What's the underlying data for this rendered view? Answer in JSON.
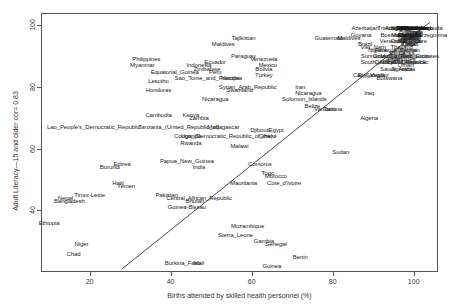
{
  "chart_data": {
    "type": "scatter",
    "title": "",
    "xlabel": "Births attended by skilled health personnel (%)",
    "ylabel": "Adult Literacy—15 and older cor= 0.83",
    "correlation": 0.83,
    "xlim": [
      8,
      106
    ],
    "ylim": [
      20,
      104
    ],
    "xticks": [
      20,
      40,
      60,
      80,
      100
    ],
    "yticks": [
      40,
      60,
      80,
      100
    ],
    "grid": false,
    "legend": "none",
    "marker": "text-label",
    "fit_line": {
      "x0": 28,
      "y0": 21,
      "x1": 104,
      "y1": 101
    },
    "points": [
      {
        "label": "Ethiopia",
        "x": 10,
        "y": 36
      },
      {
        "label": "Niger",
        "x": 18,
        "y": 29
      },
      {
        "label": "Chad",
        "x": 16,
        "y": 26
      },
      {
        "label": "Bangladesh",
        "x": 15,
        "y": 43
      },
      {
        "label": "Nepal",
        "x": 14,
        "y": 44
      },
      {
        "label": "Timor-Leste",
        "x": 20,
        "y": 45
      },
      {
        "label": "Haiti",
        "x": 27,
        "y": 49
      },
      {
        "label": "Yemen",
        "x": 29,
        "y": 48
      },
      {
        "label": "Burundi",
        "x": 25,
        "y": 54
      },
      {
        "label": "Eritrea",
        "x": 28,
        "y": 55
      },
      {
        "label": "Lao_People's_Democratic_Republic",
        "x": 21,
        "y": 67
      },
      {
        "label": "Cambodia",
        "x": 37,
        "y": 71
      },
      {
        "label": "Kenya",
        "x": 45,
        "y": 71
      },
      {
        "label": "Tanzania_(United_Republic_of)",
        "x": 42,
        "y": 67
      },
      {
        "label": "Uganda",
        "x": 45,
        "y": 64
      },
      {
        "label": "Rwanda",
        "x": 45,
        "y": 62
      },
      {
        "label": "Madagascar",
        "x": 53,
        "y": 67
      },
      {
        "label": "Djibouti",
        "x": 62,
        "y": 66
      },
      {
        "label": "Congo_(Democratic_Republic_of_the)",
        "x": 53,
        "y": 64
      },
      {
        "label": "Ghana",
        "x": 64,
        "y": 64
      },
      {
        "label": "Malawi",
        "x": 57,
        "y": 61
      },
      {
        "label": "India",
        "x": 47,
        "y": 54
      },
      {
        "label": "Papua_New_Guinea",
        "x": 44,
        "y": 56
      },
      {
        "label": "Pakistan",
        "x": 39,
        "y": 45
      },
      {
        "label": "Central_African_Republic",
        "x": 47,
        "y": 44
      },
      {
        "label": "Bhutan",
        "x": 46,
        "y": 43
      },
      {
        "label": "Guinea-Bissau",
        "x": 44,
        "y": 41
      },
      {
        "label": "Sierra_Leone",
        "x": 56,
        "y": 32
      },
      {
        "label": "Mozambique",
        "x": 59,
        "y": 35
      },
      {
        "label": "Gambia",
        "x": 63,
        "y": 30
      },
      {
        "label": "Senegal",
        "x": 66,
        "y": 29
      },
      {
        "label": "Benin",
        "x": 72,
        "y": 25
      },
      {
        "label": "Guinea",
        "x": 65,
        "y": 22
      },
      {
        "label": "Burkina_Faso",
        "x": 43,
        "y": 23
      },
      {
        "label": "Mali",
        "x": 47,
        "y": 23
      },
      {
        "label": "Mauritania",
        "x": 58,
        "y": 49
      },
      {
        "label": "Comoros",
        "x": 62,
        "y": 55
      },
      {
        "label": "Togo",
        "x": 64,
        "y": 52
      },
      {
        "label": "Morocco",
        "x": 66,
        "y": 51
      },
      {
        "label": "Cote_d'Ivoire",
        "x": 68,
        "y": 49
      },
      {
        "label": "Sudan",
        "x": 82,
        "y": 59
      },
      {
        "label": "Egypt",
        "x": 66,
        "y": 66
      },
      {
        "label": "Nicaragua",
        "x": 51,
        "y": 76
      },
      {
        "label": "Swaziland",
        "x": 57,
        "y": 79
      },
      {
        "label": "Syrian_Arab_Republic",
        "x": 59,
        "y": 80
      },
      {
        "label": "Honduras",
        "x": 37,
        "y": 79
      },
      {
        "label": "Lesotho",
        "x": 37,
        "y": 82
      },
      {
        "label": "Equatorial_Guinea",
        "x": 41,
        "y": 85
      },
      {
        "label": "Sao_Tome_and_Principe",
        "x": 49,
        "y": 83
      },
      {
        "label": "Namibia",
        "x": 55,
        "y": 83
      },
      {
        "label": "Myanmar",
        "x": 33,
        "y": 87
      },
      {
        "label": "Philippines",
        "x": 34,
        "y": 89
      },
      {
        "label": "Indonesia",
        "x": 47,
        "y": 87
      },
      {
        "label": "Zimbabwe",
        "x": 49,
        "y": 86
      },
      {
        "label": "Peru",
        "x": 51,
        "y": 85
      },
      {
        "label": "Ecuador",
        "x": 51,
        "y": 88
      },
      {
        "label": "Paraguay",
        "x": 58,
        "y": 90
      },
      {
        "label": "Venezuela",
        "x": 63,
        "y": 89
      },
      {
        "label": "Mexico",
        "x": 64,
        "y": 87
      },
      {
        "label": "Bolivia",
        "x": 63,
        "y": 86
      },
      {
        "label": "Turkey",
        "x": 63,
        "y": 84
      },
      {
        "label": "Iran",
        "x": 72,
        "y": 80
      },
      {
        "label": "Maldives",
        "x": 53,
        "y": 94
      },
      {
        "label": "Tajikistan",
        "x": 58,
        "y": 96
      },
      {
        "label": "Solomon_Islands",
        "x": 73,
        "y": 76
      },
      {
        "label": "Belize",
        "x": 75,
        "y": 74
      },
      {
        "label": "Vanuatu",
        "x": 78,
        "y": 73
      },
      {
        "label": "Tunisia",
        "x": 80,
        "y": 73
      },
      {
        "label": "Algeria",
        "x": 89,
        "y": 70
      },
      {
        "label": "Guyana",
        "x": 87,
        "y": 97
      },
      {
        "label": "Guatemala",
        "x": 79,
        "y": 96
      },
      {
        "label": "Brazil",
        "x": 88,
        "y": 94
      },
      {
        "label": "Nigeria",
        "x": 91,
        "y": 92
      },
      {
        "label": "Colombia",
        "x": 93,
        "y": 90
      },
      {
        "label": "Jordan",
        "x": 95,
        "y": 89
      },
      {
        "label": "China",
        "x": 96,
        "y": 91
      },
      {
        "label": "Thailand",
        "x": 97,
        "y": 93
      },
      {
        "label": "Panama",
        "x": 93,
        "y": 92
      },
      {
        "label": "Chile",
        "x": 99,
        "y": 96
      },
      {
        "label": "Costa_Rica",
        "x": 98,
        "y": 95
      },
      {
        "label": "Uruguay",
        "x": 99,
        "y": 97
      },
      {
        "label": "Argentina",
        "x": 99,
        "y": 97
      },
      {
        "label": "Cuba",
        "x": 100,
        "y": 99
      },
      {
        "label": "Malaysia",
        "x": 98,
        "y": 92
      },
      {
        "label": "Mongolia",
        "x": 99,
        "y": 97
      },
      {
        "label": "Kazakhstan",
        "x": 100,
        "y": 99
      },
      {
        "label": "Ukraine",
        "x": 100,
        "y": 99
      },
      {
        "label": "Romania",
        "x": 99,
        "y": 97
      },
      {
        "label": "Bulgaria",
        "x": 99,
        "y": 98
      },
      {
        "label": "Croatia",
        "x": 100,
        "y": 98
      },
      {
        "label": "Lithuania",
        "x": 100,
        "y": 99
      },
      {
        "label": "Latvia",
        "x": 100,
        "y": 99
      },
      {
        "label": "Estonia",
        "x": 100,
        "y": 99
      },
      {
        "label": "Poland",
        "x": 99,
        "y": 99
      },
      {
        "label": "Slovakia",
        "x": 99,
        "y": 99
      },
      {
        "label": "Belarus",
        "x": 100,
        "y": 99
      },
      {
        "label": "Armenia",
        "x": 98,
        "y": 99
      },
      {
        "label": "Georgia",
        "x": 98,
        "y": 99
      },
      {
        "label": "Azerbaijan",
        "x": 88,
        "y": 99
      },
      {
        "label": "Kyrgyzstan",
        "x": 98,
        "y": 99
      },
      {
        "label": "Uzbekistan",
        "x": 100,
        "y": 99
      },
      {
        "label": "Moldova",
        "x": 99,
        "y": 99
      },
      {
        "label": "Serbia",
        "x": 99,
        "y": 96
      },
      {
        "label": "Albania",
        "x": 99,
        "y": 96
      },
      {
        "label": "Lebanon",
        "x": 98,
        "y": 90
      },
      {
        "label": "Kuwait",
        "x": 99,
        "y": 94
      },
      {
        "label": "Bahrain",
        "x": 99,
        "y": 92
      },
      {
        "label": "Qatar",
        "x": 99,
        "y": 94
      },
      {
        "label": "United_Arab_Emirates",
        "x": 99,
        "y": 90
      },
      {
        "label": "Saudi_Arabia",
        "x": 96,
        "y": 86
      },
      {
        "label": "Oman",
        "x": 98,
        "y": 87
      },
      {
        "label": "Libya",
        "x": 94,
        "y": 88
      },
      {
        "label": "Philippines_2",
        "x": 97,
        "y": 89
      },
      {
        "label": "Viet_Nam",
        "x": 90,
        "y": 93
      },
      {
        "label": "Sri_Lanka",
        "x": 97,
        "y": 91
      },
      {
        "label": "Dominican_Republic",
        "x": 97,
        "y": 88
      },
      {
        "label": "Jamaica",
        "x": 97,
        "y": 86
      },
      {
        "label": "Suriname",
        "x": 90,
        "y": 90
      },
      {
        "label": "El_Salvador",
        "x": 90,
        "y": 84
      },
      {
        "label": "Trinidad_and_Tobago",
        "x": 98,
        "y": 99
      },
      {
        "label": "Mauritius",
        "x": 98,
        "y": 88
      },
      {
        "label": "Fiji",
        "x": 99,
        "y": 94
      },
      {
        "label": "Samoa",
        "x": 100,
        "y": 99
      },
      {
        "label": "Tonga",
        "x": 98,
        "y": 99
      },
      {
        "label": "Barbados",
        "x": 100,
        "y": 99
      },
      {
        "label": "Bahamas",
        "x": 99,
        "y": 95
      },
      {
        "label": "Israel",
        "x": 99,
        "y": 97
      },
      {
        "label": "Singapore",
        "x": 100,
        "y": 95
      },
      {
        "label": "Korea",
        "x": 100,
        "y": 98
      },
      {
        "label": "Russia",
        "x": 99,
        "y": 99
      },
      {
        "label": "Venezuela_2",
        "x": 95,
        "y": 95
      },
      {
        "label": "Bosnia_and_Herzegovina",
        "x": 100,
        "y": 97
      },
      {
        "label": "Macedonia",
        "x": 98,
        "y": 97
      },
      {
        "label": "Turkmenistan",
        "x": 100,
        "y": 99
      },
      {
        "label": "Cape_Verde",
        "x": 89,
        "y": 84
      },
      {
        "label": "Botswana",
        "x": 94,
        "y": 83
      },
      {
        "label": "South_Africa",
        "x": 91,
        "y": 88
      },
      {
        "label": "Antigua_and_Barbuda",
        "x": 100,
        "y": 99
      },
      {
        "label": "Saint_Lucia",
        "x": 100,
        "y": 90
      },
      {
        "label": "Grenada",
        "x": 99,
        "y": 96
      },
      {
        "label": "Dominica",
        "x": 100,
        "y": 88
      },
      {
        "label": "Maldives_2",
        "x": 84,
        "y": 96
      },
      {
        "label": "Nicaragua_2",
        "x": 74,
        "y": 78
      },
      {
        "label": "Iraq",
        "x": 89,
        "y": 78
      },
      {
        "label": "Zambia",
        "x": 47,
        "y": 70
      }
    ]
  },
  "axes": {
    "x_axis_title": "Births attended by skilled health personnel (%)",
    "y_axis_title": "Adult Literacy—15 and older cor= 0.83",
    "x_tick_labels": [
      "20",
      "40",
      "60",
      "80",
      "100"
    ],
    "y_tick_labels": [
      "40",
      "60",
      "80",
      "100"
    ]
  },
  "style": {
    "frame_color": "#555555",
    "text_color": "#1a1a1a",
    "background": "#ffffff",
    "fit_line_color": "#333333"
  }
}
